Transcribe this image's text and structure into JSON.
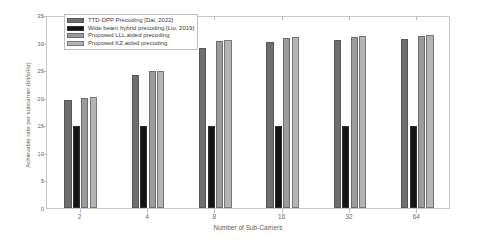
{
  "chart_data": {
    "type": "bar",
    "title": "",
    "xlabel": "Number of Sub-Carriers",
    "ylabel": "Achievable rate per subcarrier (bit/s/Hz)",
    "categories": [
      "2",
      "4",
      "8",
      "16",
      "32",
      "64"
    ],
    "ylim": [
      0,
      35
    ],
    "yticks": [
      0,
      5,
      10,
      15,
      20,
      25,
      30,
      35
    ],
    "grid": false,
    "legend_position": "upper-left",
    "series": [
      {
        "name": "TTD-DPP Precoding [Dai, 2022]",
        "color": "#6e6e6e",
        "values": [
          19.5,
          24.2,
          29.1,
          30.1,
          30.4,
          30.6
        ]
      },
      {
        "name": "Wide beam hybrid precoding [Liu, 2019]",
        "color": "#141414",
        "values": [
          14.8,
          14.9,
          14.9,
          14.9,
          14.8,
          14.9
        ]
      },
      {
        "name": "Proposed LLL aided precoding",
        "color": "#9b9b9b",
        "values": [
          20.0,
          24.8,
          30.2,
          30.9,
          31.1,
          31.2
        ]
      },
      {
        "name": "Proposed KZ aided precoding",
        "color": "#b4b4b4",
        "values": [
          20.1,
          24.8,
          30.4,
          31.0,
          31.2,
          31.3
        ]
      }
    ]
  }
}
